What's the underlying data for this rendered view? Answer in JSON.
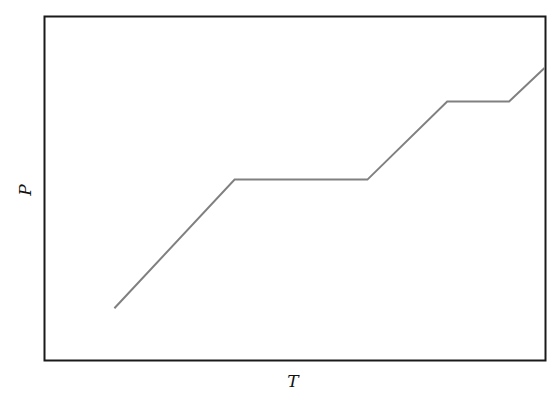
{
  "chart_data": {
    "type": "line",
    "title": "",
    "xlabel": "T",
    "ylabel": "P",
    "grid": false,
    "legend": null,
    "ticks": false,
    "xlim": [
      0,
      100
    ],
    "ylim": [
      0,
      100
    ],
    "series": [
      {
        "name": "P vs T",
        "color": "#808080",
        "x": [
          13.8,
          37.9,
          64.5,
          80.5,
          92.9,
          100
        ],
        "y": [
          15.0,
          52.6,
          52.6,
          75.4,
          75.4,
          85.2
        ]
      }
    ]
  },
  "frame": {
    "stroke": "#1a1a1a"
  }
}
